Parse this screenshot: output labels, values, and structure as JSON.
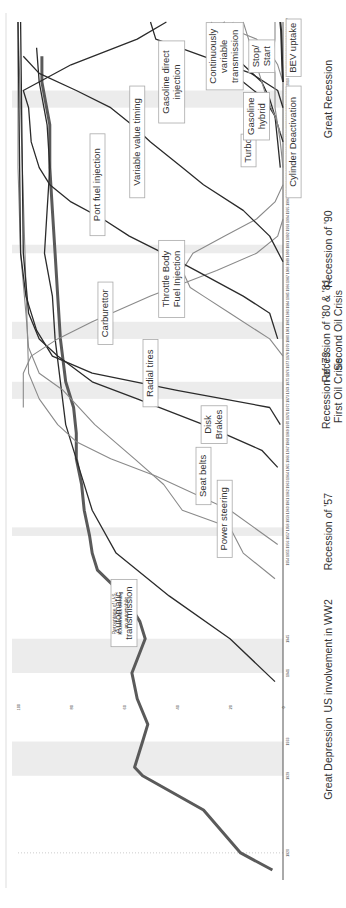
{
  "chart_data": {
    "type": "line",
    "orientation": "rotated 90 degrees clockwise (years run bottom-to-top along right edge)",
    "title": "",
    "xlabel": "Year",
    "ylabel": "Percentage",
    "ylim": [
      0,
      100
    ],
    "xlim": [
      1918,
      2017
    ],
    "yticks": [
      0,
      20,
      40,
      60,
      80,
      100
    ],
    "grid": false,
    "annotation_ylabel": "Percentage of U.S. households owning an automobile",
    "recessions": [
      {
        "label": "Great Depression",
        "start": 1929,
        "end": 1933
      },
      {
        "label": "US involvement in WW2",
        "start": 1941,
        "end": 1945
      },
      {
        "label": "Recession of '57",
        "start": 1957,
        "end": 1958
      },
      {
        "label": "Recession of '73\nFirst Oil Crisis",
        "start": 1973,
        "end": 1975
      },
      {
        "label": "Recession of '80 & '81\nSecond Oil Crisis",
        "start": 1980,
        "end": 1982
      },
      {
        "label": "Recession of '90",
        "start": 1990,
        "end": 1991
      },
      {
        "label": "Great Recession",
        "start": 2007,
        "end": 2009
      }
    ],
    "series": [
      {
        "name": "Percentage of U.S. households owning an automobile",
        "style": "thick",
        "points": [
          [
            1918,
            4
          ],
          [
            1920,
            16
          ],
          [
            1925,
            30
          ],
          [
            1929,
            53
          ],
          [
            1930,
            56
          ],
          [
            1933,
            53
          ],
          [
            1935,
            51
          ],
          [
            1938,
            55
          ],
          [
            1941,
            57
          ],
          [
            1945,
            52
          ],
          [
            1947,
            54
          ],
          [
            1950,
            60
          ],
          [
            1953,
            70
          ],
          [
            1955,
            72
          ],
          [
            1957,
            73
          ],
          [
            1960,
            75
          ],
          [
            1963,
            76
          ],
          [
            1966,
            78
          ],
          [
            1969,
            78
          ],
          [
            1972,
            79
          ],
          [
            1975,
            82
          ],
          [
            1980,
            84
          ],
          [
            1985,
            85
          ],
          [
            1990,
            86
          ],
          [
            1995,
            87
          ],
          [
            2000,
            88
          ],
          [
            2005,
            88
          ],
          [
            2010,
            91
          ],
          [
            2013,
            91
          ]
        ]
      },
      {
        "name": "Automatic transmission",
        "style": "dark",
        "points": [
          [
            1940,
            3
          ],
          [
            1945,
            20
          ],
          [
            1950,
            43
          ],
          [
            1955,
            63
          ],
          [
            1960,
            72
          ],
          [
            1965,
            77
          ],
          [
            1970,
            82
          ],
          [
            1975,
            84
          ],
          [
            1980,
            86
          ],
          [
            1985,
            87
          ],
          [
            1990,
            90
          ],
          [
            1995,
            89
          ],
          [
            2000,
            88
          ],
          [
            2005,
            89
          ],
          [
            2010,
            92
          ],
          [
            2014,
            93
          ]
        ]
      },
      {
        "name": "Power steering",
        "style": "light",
        "points": [
          [
            1952,
            3
          ],
          [
            1955,
            15
          ],
          [
            1958,
            20
          ],
          [
            1960,
            38
          ],
          [
            1963,
            45
          ],
          [
            1966,
            56
          ],
          [
            1970,
            71
          ],
          [
            1974,
            83
          ],
          [
            1976,
            92
          ],
          [
            1979,
            96
          ],
          [
            1983,
            97
          ],
          [
            1990,
            99
          ],
          [
            2000,
            100
          ],
          [
            2017,
            100
          ]
        ]
      },
      {
        "name": "Seat belts",
        "style": "light",
        "points": [
          [
            1956,
            2
          ],
          [
            1960,
            20
          ],
          [
            1964,
            48
          ],
          [
            1966,
            65
          ],
          [
            1968,
            78
          ],
          [
            1970,
            85
          ],
          [
            1973,
            92
          ],
          [
            1976,
            96
          ],
          [
            2017,
            100
          ]
        ]
      },
      {
        "name": "Disk Brakes",
        "style": "dark",
        "points": [
          [
            1965,
            2
          ],
          [
            1967,
            8
          ],
          [
            1970,
            30
          ],
          [
            1973,
            55
          ],
          [
            1975,
            72
          ],
          [
            1978,
            85
          ],
          [
            1980,
            92
          ],
          [
            1983,
            96
          ],
          [
            1990,
            98
          ],
          [
            2017,
            99
          ]
        ]
      },
      {
        "name": "Radial tires",
        "style": "dark",
        "points": [
          [
            1970,
            1
          ],
          [
            1972,
            5
          ],
          [
            1974,
            40
          ],
          [
            1976,
            72
          ],
          [
            1978,
            87
          ],
          [
            1981,
            93
          ],
          [
            1985,
            97
          ],
          [
            1990,
            99
          ],
          [
            2017,
            100
          ]
        ]
      },
      {
        "name": "Carburettor",
        "style": "light",
        "points": [
          [
            1972,
            98
          ],
          [
            1976,
            98
          ],
          [
            1978,
            95
          ],
          [
            1980,
            85
          ],
          [
            1982,
            72
          ],
          [
            1985,
            50
          ],
          [
            1988,
            25
          ],
          [
            1990,
            10
          ],
          [
            1992,
            2
          ],
          [
            1994,
            0
          ]
        ]
      },
      {
        "name": "Throttle Body Fuel Injection",
        "style": "light",
        "points": [
          [
            1978,
            0
          ],
          [
            1980,
            5
          ],
          [
            1983,
            20
          ],
          [
            1985,
            30
          ],
          [
            1986,
            35
          ],
          [
            1988,
            38
          ],
          [
            1990,
            34
          ],
          [
            1992,
            22
          ],
          [
            1994,
            10
          ],
          [
            1996,
            3
          ],
          [
            1998,
            0
          ]
        ]
      },
      {
        "name": "Port fuel injection",
        "style": "dark",
        "points": [
          [
            1980,
            2
          ],
          [
            1983,
            5
          ],
          [
            1985,
            15
          ],
          [
            1988,
            33
          ],
          [
            1990,
            45
          ],
          [
            1992,
            58
          ],
          [
            1994,
            68
          ],
          [
            1996,
            80
          ],
          [
            1998,
            88
          ],
          [
            2000,
            92
          ],
          [
            2003,
            95
          ],
          [
            2007,
            96
          ],
          [
            2009,
            98
          ],
          [
            2012,
            80
          ],
          [
            2015,
            55
          ],
          [
            2017,
            44
          ]
        ]
      },
      {
        "name": "Variable valve timing",
        "style": "dark",
        "points": [
          [
            1989,
            0
          ],
          [
            1992,
            5
          ],
          [
            1995,
            15
          ],
          [
            1998,
            30
          ],
          [
            2000,
            38
          ],
          [
            2003,
            50
          ],
          [
            2005,
            57
          ],
          [
            2007,
            65
          ],
          [
            2009,
            78
          ],
          [
            2011,
            92
          ],
          [
            2013,
            98
          ]
        ]
      },
      {
        "name": "Gasoline direct injection",
        "style": "dark",
        "points": [
          [
            2007,
            0
          ],
          [
            2009,
            2
          ],
          [
            2011,
            12
          ],
          [
            2013,
            30
          ],
          [
            2015,
            48
          ],
          [
            2017,
            50
          ]
        ]
      },
      {
        "name": "Continuously variable transmission",
        "style": "dark",
        "points": [
          [
            2003,
            0
          ],
          [
            2006,
            3
          ],
          [
            2008,
            7
          ],
          [
            2010,
            15
          ],
          [
            2012,
            22
          ],
          [
            2014,
            28
          ],
          [
            2016,
            26
          ],
          [
            2017,
            22
          ]
        ]
      },
      {
        "name": "Turbo",
        "style": "dark",
        "points": [
          [
            2000,
            1
          ],
          [
            2003,
            2
          ],
          [
            2006,
            3
          ],
          [
            2008,
            5
          ],
          [
            2010,
            8
          ],
          [
            2012,
            15
          ],
          [
            2014,
            20
          ],
          [
            2016,
            26
          ],
          [
            2017,
            27
          ]
        ]
      },
      {
        "name": "Gasoline hybrid",
        "style": "light",
        "points": [
          [
            2000,
            0
          ],
          [
            2003,
            1
          ],
          [
            2005,
            2
          ],
          [
            2007,
            3
          ],
          [
            2009,
            3
          ],
          [
            2011,
            3
          ],
          [
            2013,
            4
          ],
          [
            2015,
            3
          ],
          [
            2017,
            3
          ]
        ]
      },
      {
        "name": "Stop/Start",
        "style": "light",
        "points": [
          [
            2010,
            0
          ],
          [
            2012,
            2
          ],
          [
            2013,
            4
          ],
          [
            2015,
            10
          ],
          [
            2016,
            18
          ],
          [
            2017,
            19
          ]
        ]
      },
      {
        "name": "Cylinder Deactivation",
        "style": "light",
        "points": [
          [
            2004,
            1
          ],
          [
            2006,
            3
          ],
          [
            2008,
            6
          ],
          [
            2010,
            8
          ],
          [
            2012,
            10
          ],
          [
            2014,
            12
          ],
          [
            2016,
            14
          ],
          [
            2017,
            15
          ]
        ]
      },
      {
        "name": "BEV uptake",
        "style": "dark",
        "points": [
          [
            2010,
            0
          ],
          [
            2012,
            0.3
          ],
          [
            2014,
            0.5
          ],
          [
            2016,
            0.7
          ],
          [
            2017,
            1
          ]
        ]
      }
    ]
  },
  "labels": {
    "household": "Percentage of U.S. households owning an automobile",
    "features": [
      {
        "key": "automatic",
        "text": "Automatic transmission"
      },
      {
        "key": "power",
        "text": "Power steering"
      },
      {
        "key": "seatbelts",
        "text": "Seat belts"
      },
      {
        "key": "disk",
        "text": "Disk Brakes"
      },
      {
        "key": "radial",
        "text": "Radial tires"
      },
      {
        "key": "carb",
        "text": "Carburettor"
      },
      {
        "key": "tbi",
        "text": "Throttle Body Fuel Injection"
      },
      {
        "key": "pfi",
        "text": "Port fuel injection"
      },
      {
        "key": "vvt",
        "text": "Variable value timing"
      },
      {
        "key": "gdi",
        "text": "Gasoline direct injection"
      },
      {
        "key": "cvt",
        "text": "Continuously variable transmission"
      },
      {
        "key": "turbo",
        "text": "Turbo"
      },
      {
        "key": "hybrid",
        "text": "Gasoline hybrid"
      },
      {
        "key": "stopstart",
        "text": "Stop/ Start"
      },
      {
        "key": "cyl",
        "text": "Cylinder Deactivation"
      },
      {
        "key": "bev",
        "text": "BEV uptake"
      }
    ]
  },
  "colors": {
    "dark": "#2b2b2b",
    "light": "#8a8a8a",
    "household": "#5a5a5a",
    "recession_band": "#ececec",
    "axis": "#555555"
  }
}
